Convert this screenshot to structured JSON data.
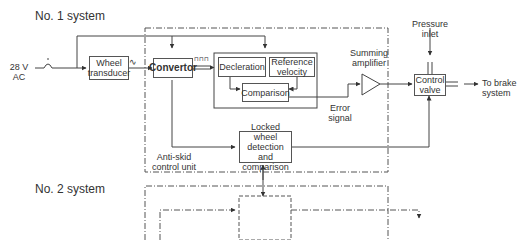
{
  "titles": {
    "system1": "No. 1 system",
    "system2": "No. 2 system"
  },
  "inputs": {
    "power_line1": "28 V",
    "power_line2": "AC",
    "pressure_line1": "Pressure",
    "pressure_line2": "inlet"
  },
  "blocks": {
    "wheel_transducer_line1": "Wheel",
    "wheel_transducer_line2": "transducer",
    "convertor": "Convertor",
    "deceleration": "Decleration",
    "reference_velocity_line1": "Reference",
    "reference_velocity_line2": "velocity",
    "comparison": "Comparison",
    "summing_amplifier_line1": "Summing",
    "summing_amplifier_line2": "amplifier",
    "control_valve_line1": "Control",
    "control_valve_line2": "valve",
    "locked_wheel_line1": "Locked wheel",
    "locked_wheel_line2": "detection and",
    "locked_wheel_line3": "comparison"
  },
  "signals": {
    "error_signal_line1": "Error",
    "error_signal_line2": "signal",
    "ac_wave_symbol": "∿",
    "pulse_symbol": "⊓⊓⊓"
  },
  "outputs": {
    "brake_line1": "To brake",
    "brake_line2": "system"
  },
  "units": {
    "anti_skid_line1": "Anti-skid",
    "anti_skid_line2": "control unit"
  },
  "colors": {
    "line": "#444444",
    "dash": "#555555",
    "text": "#333333"
  }
}
